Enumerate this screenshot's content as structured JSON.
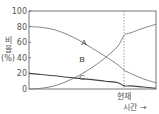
{
  "chart_data": {
    "type": "line",
    "title": "",
    "xlabel": "시간 →",
    "ylabel": "비율 (%)",
    "ylim": [
      0,
      100
    ],
    "yticks": [
      0,
      20,
      40,
      60,
      80,
      100
    ],
    "xlim": [
      0,
      10
    ],
    "grid": false,
    "legend_position": "inline labels",
    "annotations": [
      {
        "type": "vertical-dashed-line",
        "x": 7.5,
        "label": "현재"
      }
    ],
    "x": [
      0,
      1,
      2,
      3,
      4,
      5,
      6,
      7,
      7.5,
      8,
      9,
      10
    ],
    "series": [
      {
        "name": "A",
        "values": [
          80,
          79,
          76,
          70,
          62,
          52,
          42,
          31,
          24,
          20,
          13,
          8
        ],
        "color": "#666666",
        "label_at": [
          4.2,
          61
        ]
      },
      {
        "name": "B",
        "values": [
          0,
          1,
          4,
          10,
          18,
          28,
          40,
          55,
          69,
          72,
          78,
          83
        ],
        "color": "#666666",
        "label_at": [
          4.1,
          39
        ]
      },
      {
        "name": "C",
        "values": [
          20,
          18.5,
          17,
          15,
          13.5,
          12,
          10,
          8,
          4,
          4,
          2.5,
          1
        ],
        "color": "#333333",
        "label_at": [
          4.1,
          16
        ]
      }
    ]
  },
  "labels": {
    "y_axis_line1": "비",
    "y_axis_line2": "율",
    "y_axis_unit": "(%)",
    "now_marker": "현재",
    "x_axis": "시간 →",
    "series_a": "A",
    "series_b": "B",
    "series_c": "C",
    "tick_100": "100",
    "tick_80": "80",
    "tick_60": "60",
    "tick_40": "40",
    "tick_20": "20",
    "tick_0": "0"
  }
}
